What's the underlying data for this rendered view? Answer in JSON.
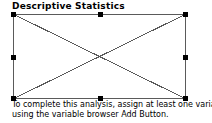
{
  "window": {
    "title": "Descriptive Statistics",
    "background_color": "#ffffff",
    "text_color": "#000000"
  },
  "placeholder": {
    "name": "chart-placeholder",
    "state": "selected",
    "border_color": "#5a5a5a",
    "fill_color": "#ffffff",
    "cross_color": "#5a5a5a",
    "handle_color": "#000000",
    "handles": [
      "top-left",
      "top-center",
      "top-right",
      "middle-left",
      "middle-right",
      "bottom-left",
      "bottom-center",
      "bottom-right"
    ]
  },
  "instructions": {
    "line1": "To complete this analysis, assign at least one variable",
    "line2": "using the variable browser Add Button."
  }
}
